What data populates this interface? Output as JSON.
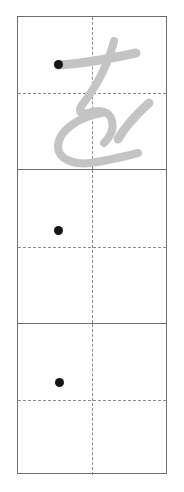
{
  "worksheet": {
    "type": "japanese-handwriting-practice-grid",
    "script": "hiragana",
    "character": "を",
    "character_romaji": "wo",
    "cell_count": 3,
    "colors": {
      "page_background": "#ffffff",
      "grid_border": "#6e6e6e",
      "guide_line": "#8a8a8a",
      "start_dot": "#161616",
      "model_stroke": "#c4c4c4"
    },
    "guides": {
      "horizontal": "dashed",
      "vertical": "dashed"
    },
    "cells": [
      {
        "index": 1,
        "label": "practice-cell-1",
        "has_model_character": true,
        "model_character": "を",
        "has_start_dot": true,
        "start_dot_label": "stroke-start-dot"
      },
      {
        "index": 2,
        "label": "practice-cell-2",
        "has_model_character": false,
        "model_character": "",
        "has_start_dot": true,
        "start_dot_label": "stroke-start-dot"
      },
      {
        "index": 3,
        "label": "practice-cell-3",
        "has_model_character": false,
        "model_character": "",
        "has_start_dot": true,
        "start_dot_label": "stroke-start-dot"
      }
    ]
  }
}
